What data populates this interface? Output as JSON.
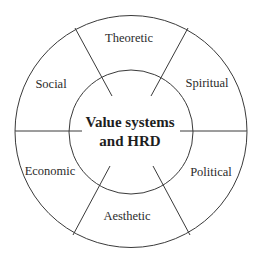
{
  "diagram": {
    "center": {
      "line1": "Value systems",
      "line2": "and HRD"
    },
    "segments": [
      {
        "label": "Theoretic"
      },
      {
        "label": "Spiritual"
      },
      {
        "label": "Political"
      },
      {
        "label": "Aesthetic"
      },
      {
        "label": "Economic"
      },
      {
        "label": "Social"
      }
    ],
    "colors": {
      "stroke": "#3a3a3a",
      "text": "#2b2b2b",
      "background": "#ffffff"
    }
  }
}
